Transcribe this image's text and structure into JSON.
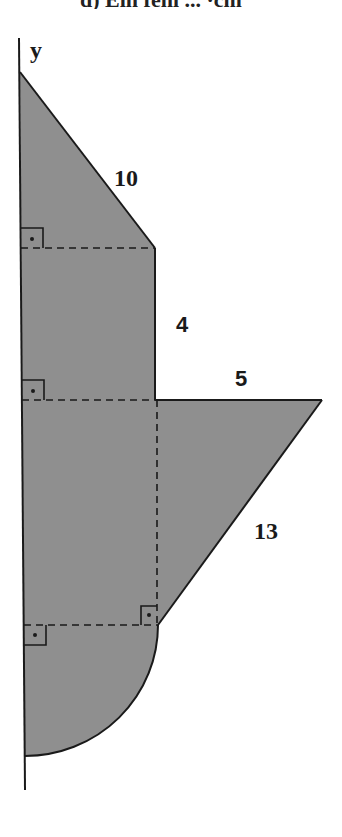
{
  "caption": {
    "text": "d) Ein fehl ...  ·cm",
    "note": "truncated at top edge"
  },
  "diagram": {
    "axis_label": "y",
    "fill_color": "#8f8f8f",
    "stroke_color": "#1a1a1a",
    "shapes": [
      {
        "name": "top-triangle",
        "type": "right-triangle",
        "hypotenuse_label": "10"
      },
      {
        "name": "middle-rectangle",
        "type": "rectangle",
        "side_label": "4"
      },
      {
        "name": "right-triangle",
        "type": "right-triangle",
        "top_label": "5",
        "hypotenuse_label": "13"
      },
      {
        "name": "lower-rectangle",
        "type": "rectangle"
      },
      {
        "name": "quarter-circle",
        "type": "quarter-circle"
      }
    ],
    "labels": {
      "hyp_top": "10",
      "side_mid": "4",
      "top_right": "5",
      "hyp_right": "13"
    },
    "right_angle_markers": 4
  }
}
